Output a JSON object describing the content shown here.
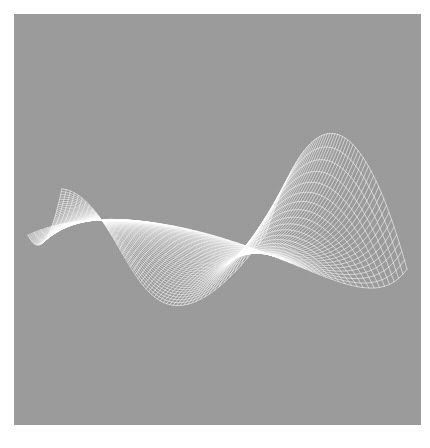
{
  "figure": {
    "title": "",
    "caption": "",
    "background_color": "#ffffff",
    "panel_color": "#9b9b9b",
    "line_color": "#ffffff",
    "panel": {
      "x": 14,
      "y": 14,
      "width": 407,
      "height": 411
    }
  },
  "chart_data": {
    "type": "line",
    "render_style": "3d-wireframe-mesh",
    "title": "",
    "subtitle": "",
    "xlabel": "",
    "ylabel": "",
    "zlabel": "",
    "grid": false,
    "legend": null,
    "axes_visible": false,
    "tick_labels": [],
    "annotations": [],
    "surface": {
      "description": "Parametric 3D surface drawn as a dense white wireframe mesh on a flat gray panel; a saddle/fold sheet with a high arched crest at the upper right, a long tapering cusp running to the lower left, and a sharp downward corner at the lower right.",
      "u_range": [
        -1,
        1
      ],
      "v_range": [
        -1,
        1
      ],
      "u_lines": 56,
      "v_lines": 56,
      "line_width": 0.55,
      "line_color": "#ffffff",
      "function": "z = a*u^2 - b*v^2 + c*u*v  (hyperbolic saddle sheet with twist)",
      "coefficients": {
        "a": 1.0,
        "b": 1.0,
        "c": 0.55,
        "twist": 0.9,
        "taper": 1.0
      },
      "projection": {
        "type": "orthographic",
        "azimuth_deg": 38,
        "elevation_deg": 26,
        "roll_deg": 0,
        "scale": 1.0
      }
    },
    "silhouette_landmarks": [
      {
        "name": "crest-apex",
        "x": 300,
        "y": 70
      },
      {
        "name": "right-fold-edge",
        "x": 405,
        "y": 185
      },
      {
        "name": "lower-right-cusp",
        "x": 320,
        "y": 382
      },
      {
        "name": "left-tail-tip",
        "x": 32,
        "y": 410
      },
      {
        "name": "upper-left-ridge",
        "x": 175,
        "y": 120
      }
    ],
    "x": [],
    "values": []
  }
}
